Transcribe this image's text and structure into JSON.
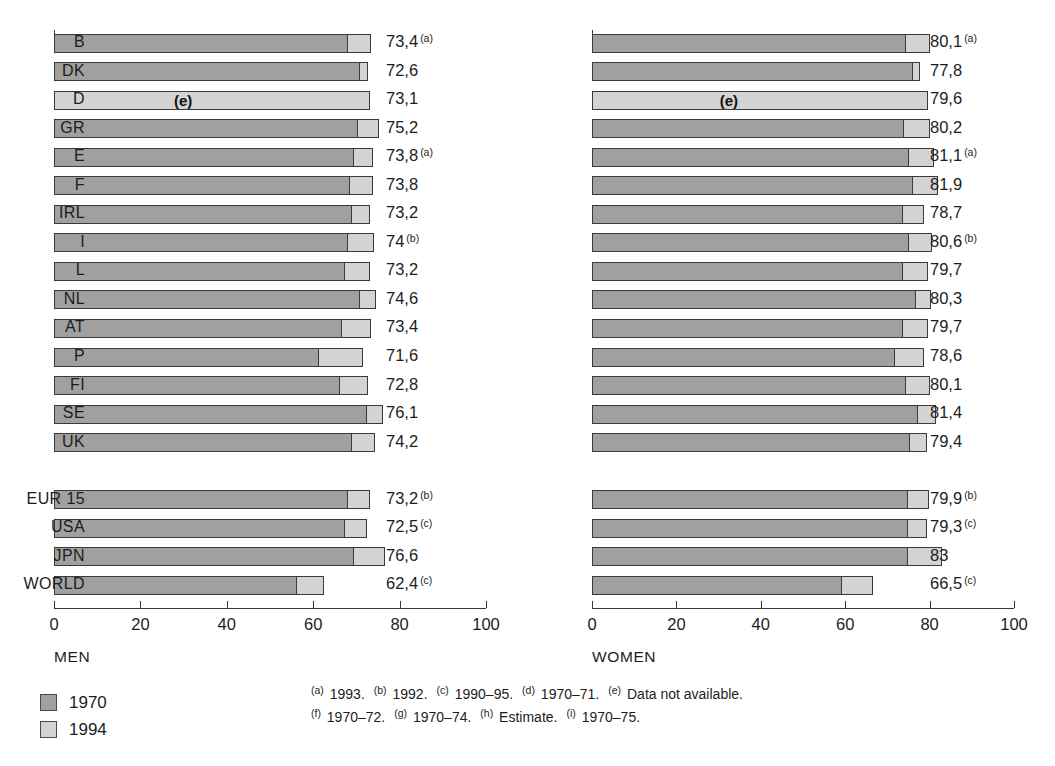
{
  "chart_data": {
    "type": "bar",
    "title": "",
    "orientation": "horizontal",
    "grid": false,
    "legend_position": "bottom-left",
    "xlabel": "",
    "ylabel": "",
    "xlim": [
      0,
      100
    ],
    "xticks": [
      0,
      20,
      40,
      60,
      80,
      100
    ],
    "series": [
      {
        "name": "1970",
        "color": "#a0a0a0"
      },
      {
        "name": "1994",
        "color": "#d3d3d3"
      }
    ],
    "panels": [
      {
        "caption": "MEN",
        "categories": [
          "B",
          "DK",
          "D",
          "GR",
          "E",
          "F",
          "IRL",
          "I",
          "L",
          "NL",
          "AT",
          "P",
          "FI",
          "SE",
          "UK",
          "EUR 15",
          "USA",
          "JPN",
          "WORLD"
        ],
        "values_1970": [
          67.8,
          70.7,
          null,
          70.1,
          69.2,
          68.4,
          68.8,
          67.9,
          67.1,
          70.7,
          66.5,
          61.2,
          65.9,
          72.2,
          68.7,
          67.9,
          67.1,
          69.3,
          56.0
        ],
        "values_1994": [
          73.4,
          72.6,
          73.1,
          75.2,
          73.8,
          73.8,
          73.2,
          74.0,
          73.2,
          74.6,
          73.4,
          71.6,
          72.8,
          76.1,
          74.2,
          73.2,
          72.5,
          76.6,
          62.4
        ]
      },
      {
        "caption": "WOMEN",
        "categories": [
          "B",
          "DK",
          "D",
          "GR",
          "E",
          "F",
          "IRL",
          "I",
          "L",
          "NL",
          "AT",
          "P",
          "FI",
          "SE",
          "UK",
          "EUR 15",
          "USA",
          "JPN",
          "WORLD"
        ],
        "values_1970": [
          74.2,
          75.9,
          null,
          73.6,
          74.8,
          75.9,
          73.5,
          74.9,
          73.4,
          76.5,
          73.4,
          71.5,
          74.2,
          77.1,
          75.0,
          74.6,
          74.7,
          74.7,
          59.0
        ],
        "values_1994": [
          80.1,
          77.8,
          79.6,
          80.2,
          81.1,
          81.9,
          78.7,
          80.6,
          79.7,
          80.3,
          79.7,
          78.6,
          80.1,
          81.4,
          79.4,
          79.9,
          79.3,
          83.0,
          66.5
        ]
      }
    ]
  },
  "panels": {
    "men": {
      "caption": "MEN",
      "rows": [
        {
          "label": "B",
          "value_text": "73,4",
          "note": "a",
          "v1970": 67.8,
          "v1994": 73.4,
          "estimate": false
        },
        {
          "label": "DK",
          "value_text": "72,6",
          "note": "",
          "v1970": 70.7,
          "v1994": 72.6,
          "estimate": false
        },
        {
          "label": "D",
          "value_text": "73,1",
          "note": "",
          "v1970": null,
          "v1994": 73.1,
          "estimate": true,
          "estimate_mark": "(e)"
        },
        {
          "label": "GR",
          "value_text": "75,2",
          "note": "",
          "v1970": 70.1,
          "v1994": 75.2,
          "estimate": false
        },
        {
          "label": "E",
          "value_text": "73,8",
          "note": "a",
          "v1970": 69.2,
          "v1994": 73.8,
          "estimate": false
        },
        {
          "label": "F",
          "value_text": "73,8",
          "note": "",
          "v1970": 68.4,
          "v1994": 73.8,
          "estimate": false
        },
        {
          "label": "IRL",
          "value_text": "73,2",
          "note": "",
          "v1970": 68.8,
          "v1994": 73.2,
          "estimate": false
        },
        {
          "label": "I",
          "value_text": "74",
          "note": "b",
          "v1970": 67.9,
          "v1994": 74.0,
          "estimate": false
        },
        {
          "label": "L",
          "value_text": "73,2",
          "note": "",
          "v1970": 67.1,
          "v1994": 73.2,
          "estimate": false
        },
        {
          "label": "NL",
          "value_text": "74,6",
          "note": "",
          "v1970": 70.7,
          "v1994": 74.6,
          "estimate": false
        },
        {
          "label": "AT",
          "value_text": "73,4",
          "note": "",
          "v1970": 66.5,
          "v1994": 73.4,
          "estimate": false
        },
        {
          "label": "P",
          "value_text": "71,6",
          "note": "",
          "v1970": 61.2,
          "v1994": 71.6,
          "estimate": false
        },
        {
          "label": "FI",
          "value_text": "72,8",
          "note": "",
          "v1970": 65.9,
          "v1994": 72.8,
          "estimate": false
        },
        {
          "label": "SE",
          "value_text": "76,1",
          "note": "",
          "v1970": 72.2,
          "v1994": 76.1,
          "estimate": false
        },
        {
          "label": "UK",
          "value_text": "74,2",
          "note": "",
          "v1970": 68.7,
          "v1994": 74.2,
          "estimate": false
        },
        {
          "label": "",
          "value_text": "",
          "note": "",
          "v1970": null,
          "v1994": null,
          "spacer": true
        },
        {
          "label": "EUR 15",
          "value_text": "73,2",
          "note": "b",
          "v1970": 67.9,
          "v1994": 73.2,
          "estimate": false
        },
        {
          "label": "USA",
          "value_text": "72,5",
          "note": "c",
          "v1970": 67.1,
          "v1994": 72.5,
          "estimate": false
        },
        {
          "label": "JPN",
          "value_text": "76,6",
          "note": "",
          "v1970": 69.3,
          "v1994": 76.6,
          "estimate": false
        },
        {
          "label": "WORLD",
          "value_text": "62,4",
          "note": "c",
          "v1970": 56.0,
          "v1994": 62.4,
          "estimate": false
        }
      ]
    },
    "women": {
      "caption": "WOMEN",
      "rows": [
        {
          "label": "B",
          "value_text": "80,1",
          "note": "a",
          "v1970": 74.2,
          "v1994": 80.1,
          "estimate": false
        },
        {
          "label": "DK",
          "value_text": "77,8",
          "note": "",
          "v1970": 75.9,
          "v1994": 77.8,
          "estimate": false
        },
        {
          "label": "D",
          "value_text": "79,6",
          "note": "",
          "v1970": null,
          "v1994": 79.6,
          "estimate": true,
          "estimate_mark": "(e)"
        },
        {
          "label": "GR",
          "value_text": "80,2",
          "note": "",
          "v1970": 73.6,
          "v1994": 80.2,
          "estimate": false
        },
        {
          "label": "E",
          "value_text": "81,1",
          "note": "a",
          "v1970": 74.8,
          "v1994": 81.1,
          "estimate": false
        },
        {
          "label": "F",
          "value_text": "81,9",
          "note": "",
          "v1970": 75.9,
          "v1994": 81.9,
          "estimate": false
        },
        {
          "label": "IRL",
          "value_text": "78,7",
          "note": "",
          "v1970": 73.5,
          "v1994": 78.7,
          "estimate": false
        },
        {
          "label": "I",
          "value_text": "80,6",
          "note": "b",
          "v1970": 74.9,
          "v1994": 80.6,
          "estimate": false
        },
        {
          "label": "L",
          "value_text": "79,7",
          "note": "",
          "v1970": 73.4,
          "v1994": 79.7,
          "estimate": false
        },
        {
          "label": "NL",
          "value_text": "80,3",
          "note": "",
          "v1970": 76.5,
          "v1994": 80.3,
          "estimate": false
        },
        {
          "label": "AT",
          "value_text": "79,7",
          "note": "",
          "v1970": 73.4,
          "v1994": 79.7,
          "estimate": false
        },
        {
          "label": "P",
          "value_text": "78,6",
          "note": "",
          "v1970": 71.5,
          "v1994": 78.6,
          "estimate": false
        },
        {
          "label": "FI",
          "value_text": "80,1",
          "note": "",
          "v1970": 74.2,
          "v1994": 80.1,
          "estimate": false
        },
        {
          "label": "SE",
          "value_text": "81,4",
          "note": "",
          "v1970": 77.1,
          "v1994": 81.4,
          "estimate": false
        },
        {
          "label": "UK",
          "value_text": "79,4",
          "note": "",
          "v1970": 75.0,
          "v1994": 79.4,
          "estimate": false
        },
        {
          "label": "",
          "value_text": "",
          "note": "",
          "v1970": null,
          "v1994": null,
          "spacer": true
        },
        {
          "label": "EUR 15",
          "value_text": "79,9",
          "note": "b",
          "v1970": 74.6,
          "v1994": 79.9,
          "estimate": false
        },
        {
          "label": "USA",
          "value_text": "79,3",
          "note": "c",
          "v1970": 74.7,
          "v1994": 79.3,
          "estimate": false
        },
        {
          "label": "JPN",
          "value_text": "83",
          "note": "",
          "v1970": 74.7,
          "v1994": 83.0,
          "estimate": false
        },
        {
          "label": "WORLD",
          "value_text": "66,5",
          "note": "c",
          "v1970": 59.0,
          "v1994": 66.5,
          "estimate": false
        }
      ]
    }
  },
  "axis": {
    "ticks": [
      "0",
      "20",
      "40",
      "60",
      "80",
      "100"
    ]
  },
  "legend": {
    "items": [
      {
        "label": "1970",
        "color": "#a0a0a0"
      },
      {
        "label": "1994",
        "color": "#d3d3d3"
      }
    ]
  },
  "footnotes": {
    "line1": [
      {
        "mark": "a",
        "text": "1993."
      },
      {
        "mark": "b",
        "text": "1992."
      },
      {
        "mark": "c",
        "text": "1990–95."
      },
      {
        "mark": "d",
        "text": "1970–71."
      },
      {
        "mark": "e",
        "text": "Data not available."
      }
    ],
    "line2": [
      {
        "mark": "f",
        "text": "1970–72."
      },
      {
        "mark": "g",
        "text": "1970–74."
      },
      {
        "mark": "h",
        "text": "Estimate."
      },
      {
        "mark": "i",
        "text": "1970–75."
      }
    ]
  }
}
